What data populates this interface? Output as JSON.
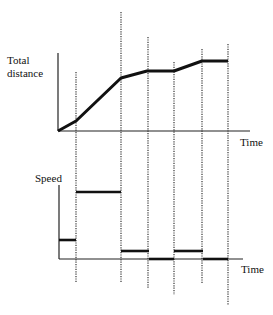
{
  "chart_data": [
    {
      "type": "line",
      "title": "",
      "ylabel": "Total distance",
      "xlabel": "Time",
      "grid": false,
      "segment_boundaries": [
        "t1",
        "t2",
        "t3",
        "t4",
        "t5",
        "t6"
      ],
      "x": [
        "t0",
        "t1",
        "t2",
        "t3",
        "t4",
        "t5",
        "t6"
      ],
      "values": [
        0,
        0.19,
        0.98,
        1.11,
        1.11,
        1.3,
        1.3
      ],
      "description": "Total distance vs time: slow rise, steep rise, slight rise, flat, slight rise, flat"
    },
    {
      "type": "line",
      "title": "",
      "ylabel": "Speed",
      "xlabel": "Time",
      "grid": false,
      "step": true,
      "x": [
        "t0-t1",
        "t1-t2",
        "t2-t3",
        "t3-t4",
        "t4-t5",
        "t5-t6"
      ],
      "values": [
        0.28,
        1.0,
        0.12,
        0,
        0.12,
        0
      ],
      "description": "Speed step function derived from the distance graph"
    }
  ],
  "labels": {
    "top_y": [
      "Total",
      "distance"
    ],
    "top_x": "Time",
    "bottom_y": "Speed",
    "bottom_x": "Time"
  },
  "geometry": {
    "top_axis": {
      "x0": 58,
      "y0": 131,
      "ytop": 53,
      "xend": 250
    },
    "top_points": [
      [
        58,
        131
      ],
      [
        76,
        121
      ],
      [
        121,
        78
      ],
      [
        147,
        71
      ],
      [
        174,
        71
      ],
      [
        202,
        61
      ],
      [
        228,
        61
      ]
    ],
    "bottom_axis": {
      "x0": 59,
      "y0": 259,
      "ytop": 185,
      "xend": 243
    },
    "bottom_segments": [
      [
        59,
        76,
        240
      ],
      [
        76,
        121,
        192
      ],
      [
        121,
        149,
        251
      ],
      [
        149,
        174,
        259
      ],
      [
        174,
        203,
        251
      ],
      [
        203,
        228,
        259
      ]
    ],
    "dotted_lines": [
      [
        76,
        72,
        283
      ],
      [
        121,
        12,
        283
      ],
      [
        148,
        37,
        288
      ],
      [
        174,
        62,
        295
      ],
      [
        202,
        49,
        283
      ],
      [
        228,
        44,
        305
      ]
    ]
  }
}
